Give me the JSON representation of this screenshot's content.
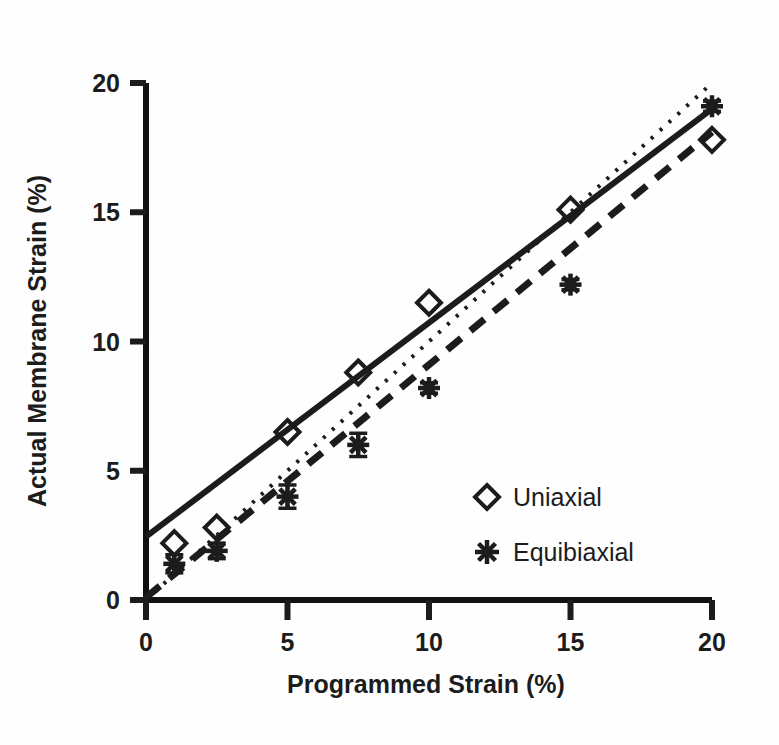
{
  "chart_data": {
    "type": "scatter",
    "title": "",
    "xlabel": "Programmed Strain (%)",
    "ylabel": "Actual Membrane Strain (%)",
    "xlim": [
      0,
      20
    ],
    "ylim": [
      0,
      20
    ],
    "xticks": [
      0,
      5,
      10,
      15,
      20
    ],
    "yticks": [
      0,
      5,
      10,
      15,
      20
    ],
    "xtick_labels": [
      "0",
      "5",
      "10",
      "15",
      "20"
    ],
    "ytick_labels": [
      "0",
      "5",
      "10",
      "15",
      "20"
    ],
    "grid": false,
    "legend_position": "center-right",
    "series": [
      {
        "name": "Uniaxial",
        "marker": "diamond-open",
        "x": [
          1,
          2.5,
          5,
          7.5,
          10,
          15,
          20
        ],
        "y": [
          2.2,
          2.8,
          6.5,
          8.8,
          11.5,
          15.1,
          17.8
        ],
        "yerr": [
          0.2,
          0.2,
          0.2,
          0.2,
          0.2,
          0.2,
          0.2
        ]
      },
      {
        "name": "Equibiaxial",
        "marker": "asterisk-filled",
        "x": [
          1,
          2.5,
          5,
          7.5,
          10,
          15,
          20
        ],
        "y": [
          1.4,
          1.9,
          4.0,
          6.0,
          8.2,
          12.2,
          19.1
        ],
        "yerr": [
          0.35,
          0.3,
          0.45,
          0.45,
          0.2,
          0.2,
          0.2
        ]
      }
    ],
    "trendlines": [
      {
        "name": "uniaxial-fit",
        "style": "solid",
        "x0": 0.0,
        "y0": 2.45,
        "x1": 20.0,
        "y1": 19.0
      },
      {
        "name": "identity-reference",
        "style": "dotted",
        "x0": 0.0,
        "y0": 0.0,
        "x1": 20.0,
        "y1": 20.0
      },
      {
        "name": "equibiaxial-fit",
        "style": "dashed",
        "x0": 0.0,
        "y0": 0.1,
        "x1": 20.0,
        "y1": 18.1
      }
    ],
    "legend": [
      {
        "marker": "diamond-open",
        "label": "Uniaxial"
      },
      {
        "marker": "asterisk-filled",
        "label": "Equibiaxial"
      }
    ],
    "colors": {
      "ink": "#1c1c1c",
      "background": "#fefefe",
      "axis": "#111111"
    }
  }
}
